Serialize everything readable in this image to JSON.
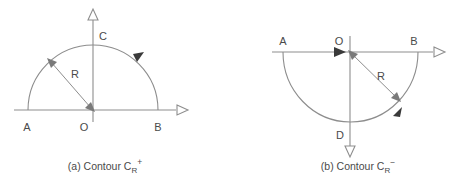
{
  "figure": {
    "background_color": "#ffffff",
    "line_color": "#8d8d8d",
    "text_color": "#4a4a4a",
    "arrow_fill_color": "#3a3a3a"
  },
  "panel_a": {
    "caption_prefix": "(a) Contour C",
    "caption_subscript": "R",
    "caption_superscript": "+",
    "labels": {
      "left_point": "A",
      "origin": "O",
      "right_point": "B",
      "top_point": "C",
      "radius": "R"
    },
    "orientation": "counterclockwise",
    "semicircle": "upper"
  },
  "panel_b": {
    "caption_prefix": "(b) Contour C",
    "caption_subscript": "R",
    "caption_superscript": "−",
    "labels": {
      "left_point": "A",
      "origin": "O",
      "right_point": "B",
      "bottom_point": "D",
      "radius": "R"
    },
    "orientation": "clockwise",
    "semicircle": "lower"
  }
}
